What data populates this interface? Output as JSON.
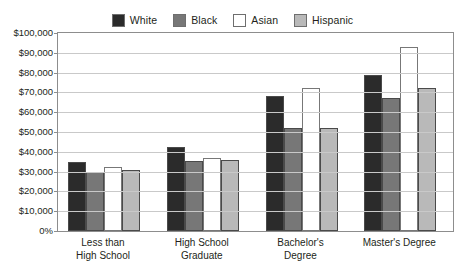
{
  "chart_data": {
    "type": "bar",
    "title": "",
    "xlabel": "",
    "ylabel": "",
    "ylim": [
      0,
      100000
    ],
    "grid": true,
    "legend_position": "top-center",
    "categories": [
      "Less than High School",
      "High School Graduate",
      "Bachelor's Degree",
      "Master's Degree"
    ],
    "category_lines": [
      [
        "Less than",
        "High School"
      ],
      [
        "High School",
        "Graduate"
      ],
      [
        "Bachelor's",
        "Degree"
      ],
      [
        "Master's Degree"
      ]
    ],
    "ytick_labels": [
      "$100,000",
      "$90,000",
      "$80,000",
      "$70,000",
      "$60,000",
      "$50,000",
      "$40,000",
      "$30,000",
      "$20,000",
      "$10,000",
      "0%"
    ],
    "ytick_values": [
      100000,
      90000,
      80000,
      70000,
      60000,
      50000,
      40000,
      30000,
      20000,
      10000,
      0
    ],
    "series": [
      {
        "name": "White",
        "color": "#2b2b2b",
        "values": [
          35000,
          42500,
          68000,
          79000
        ]
      },
      {
        "name": "Black",
        "color": "#777777",
        "values": [
          30000,
          35500,
          52000,
          67000
        ]
      },
      {
        "name": "Asian",
        "color": "#ffffff",
        "values": [
          32500,
          37000,
          72000,
          93000
        ]
      },
      {
        "name": "Hispanic",
        "color": "#b9b9b9",
        "values": [
          31000,
          36000,
          52000,
          72000
        ]
      }
    ]
  },
  "axis": {
    "frame_color": "#8d8d8d",
    "grid_color": "#c9c9c9"
  }
}
